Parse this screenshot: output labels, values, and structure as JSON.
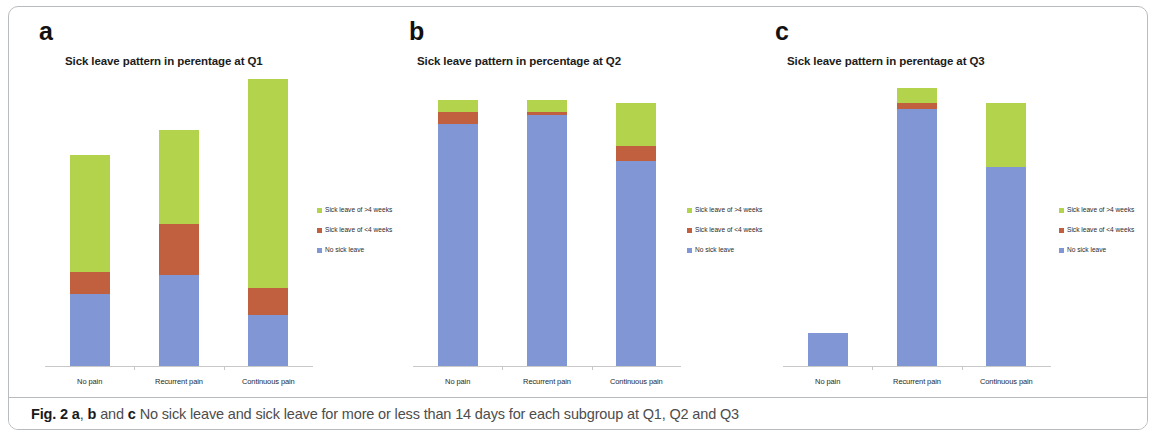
{
  "figure": {
    "caption_prefix": "Fig. 2",
    "caption_a": "a",
    "caption_comma": ",",
    "caption_b": "b",
    "caption_and": "and",
    "caption_c": "c",
    "caption_rest": "No sick leave and sick leave for more or less than 14 days for each subgroup at Q1, Q2 and Q3"
  },
  "legend": {
    "items": [
      {
        "label": "Sick leave of >4 weeks",
        "color": "#b3d34d",
        "key": "green"
      },
      {
        "label": "Sick leave of <4 weeks",
        "color": "#c0603f",
        "key": "red"
      },
      {
        "label": "No sick leave",
        "color": "#8196d4",
        "key": "blue"
      }
    ]
  },
  "panels": [
    {
      "letter": "a",
      "title": "Sick leave pattern in perentage at Q1"
    },
    {
      "letter": "b",
      "title": "Sick leave pattern in percentage at Q2"
    },
    {
      "letter": "c",
      "title": "Sick leave pattern in perentage at Q3"
    }
  ],
  "chart_data": [
    {
      "type": "bar",
      "stacked": true,
      "panel": "a",
      "title": "Sick leave pattern in perentage at Q1",
      "xlabel": "",
      "ylabel": "",
      "ylim": [
        0,
        100
      ],
      "grid": false,
      "legend_position": "right",
      "categories": [
        "No pain",
        "Recurrent pain",
        "Continuous pain"
      ],
      "series": [
        {
          "name": "No sick leave",
          "color": "#8196d4",
          "values": [
            24,
            30,
            17
          ]
        },
        {
          "name": "Sick leave of <4 weeks",
          "color": "#c0603f",
          "values": [
            7,
            17,
            9
          ]
        },
        {
          "name": "Sick leave of >4 weeks",
          "color": "#b3d34d",
          "values": [
            39,
            31,
            69
          ]
        }
      ]
    },
    {
      "type": "bar",
      "stacked": true,
      "panel": "b",
      "title": "Sick leave pattern in percentage at Q2",
      "xlabel": "",
      "ylabel": "",
      "ylim": [
        0,
        100
      ],
      "grid": false,
      "legend_position": "right",
      "categories": [
        "No pain",
        "Recurrent pain",
        "Continuous pain"
      ],
      "series": [
        {
          "name": "No sick leave",
          "color": "#8196d4",
          "values": [
            80,
            83,
            68
          ]
        },
        {
          "name": "Sick leave of <4 weeks",
          "color": "#c0603f",
          "values": [
            4,
            1,
            5
          ]
        },
        {
          "name": "Sick leave of >4 weeks",
          "color": "#b3d34d",
          "values": [
            4,
            4,
            14
          ]
        }
      ]
    },
    {
      "type": "bar",
      "stacked": true,
      "panel": "c",
      "title": "Sick leave pattern in perentage at Q3",
      "xlabel": "",
      "ylabel": "",
      "ylim": [
        0,
        100
      ],
      "grid": false,
      "legend_position": "right",
      "categories": [
        "No pain",
        "Recurrent pain",
        "Continuous pain"
      ],
      "series": [
        {
          "name": "No sick leave",
          "color": "#8196d4",
          "values": [
            11,
            85,
            66
          ]
        },
        {
          "name": "Sick leave of <4 weeks",
          "color": "#c0603f",
          "values": [
            0,
            2,
            0
          ]
        },
        {
          "name": "Sick leave of >4 weeks",
          "color": "#b3d34d",
          "values": [
            0,
            5,
            21
          ]
        }
      ]
    }
  ]
}
